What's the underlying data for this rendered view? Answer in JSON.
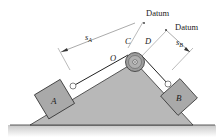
{
  "diagram": {
    "labels": {
      "datum_top": "Datum",
      "datum_right": "Datum",
      "s_a_main": "s",
      "s_a_sub": "A",
      "s_b_main": "s",
      "s_b_sub": "B",
      "point_c": "C",
      "point_d": "D",
      "point_o": "O",
      "block_a": "A",
      "block_b": "B"
    },
    "colors": {
      "wedge_fill": "#b4b4b4",
      "block_fill": "#a8a8a8",
      "pulley_fill": "#9a9a9a",
      "line": "#222222",
      "dim_line": "#555555",
      "ground_shadow": "#d8d8d8"
    }
  }
}
